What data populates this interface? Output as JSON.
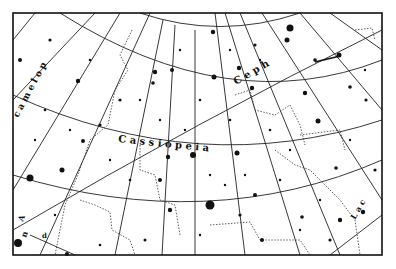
{
  "map": {
    "title": "Star chart — Cassiopeia region",
    "background": "#ffffff",
    "ink": "#111111",
    "frame": {
      "x": 13,
      "y": 13,
      "width": 369,
      "height": 242
    },
    "constellations": [
      {
        "name": "Cassiopeia",
        "letters": [
          "C",
          "a",
          "s",
          "s",
          "i",
          "o",
          "p",
          "e",
          "i",
          "a"
        ]
      },
      {
        "name": "Cepheus",
        "letters": [
          "C",
          "e",
          "p",
          "h"
        ]
      },
      {
        "name": "Camelopardalis",
        "letters": [
          "c",
          "a",
          "m",
          "e",
          "l",
          "o",
          "p"
        ]
      },
      {
        "name": "Lacerta",
        "letters": [
          "L",
          "a",
          "c"
        ]
      },
      {
        "name": "Andromeda",
        "letters": [
          "A",
          "n",
          "d",
          "r",
          "o"
        ]
      }
    ],
    "labels": {
      "cassiopeia": "C a s s i o p e i a",
      "cepheus": "C e p h",
      "camelopardalis": "c a m e l o p",
      "lacerta": "L a c",
      "andromeda_a": "A",
      "andromeda_n": "n",
      "andromeda_d": "d"
    }
  }
}
